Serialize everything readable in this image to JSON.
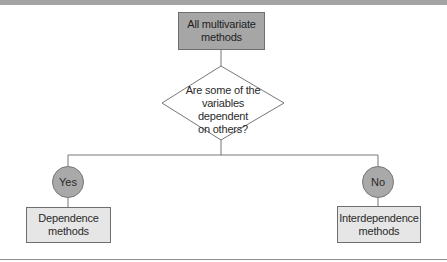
{
  "diagram": {
    "type": "decision-flowchart",
    "root": {
      "line1": "All multivariate",
      "line2": "methods"
    },
    "decision": {
      "line1": "Are some of the",
      "line2": "variables dependent",
      "line3": "on others?"
    },
    "branches": [
      {
        "answer": "Yes",
        "result_line1": "Dependence",
        "result_line2": "methods"
      },
      {
        "answer": "No",
        "result_line1": "Interdependence",
        "result_line2": "methods"
      }
    ],
    "colors": {
      "root_fill": "#a6a6a6",
      "answer_fill": "#a9a9a9",
      "leaf_fill": "#e6e6e6",
      "stroke": "#6e6e6e",
      "top_bar": "#a4a4a4"
    }
  }
}
